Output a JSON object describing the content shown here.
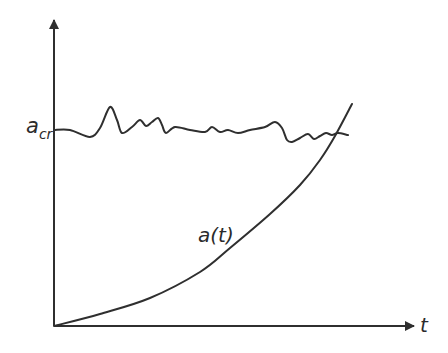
{
  "chart_data": {
    "type": "line",
    "title": "",
    "xlabel": "t",
    "ylabel": "",
    "grid": false,
    "legend": "none",
    "axes": {
      "x_arrow": true,
      "y_arrow": true,
      "ticks": false
    },
    "series": [
      {
        "name": "a_cr",
        "label": "a",
        "label_sub": "cr",
        "description": "fluctuating critical threshold, roughly constant",
        "points_px": [
          [
            54,
            130
          ],
          [
            70,
            130
          ],
          [
            90,
            137
          ],
          [
            100,
            128
          ],
          [
            110,
            107
          ],
          [
            117,
            120
          ],
          [
            122,
            133
          ],
          [
            132,
            127
          ],
          [
            140,
            120
          ],
          [
            146,
            126
          ],
          [
            152,
            122
          ],
          [
            158,
            118
          ],
          [
            162,
            125
          ],
          [
            166,
            133
          ],
          [
            175,
            127
          ],
          [
            190,
            130
          ],
          [
            205,
            132
          ],
          [
            212,
            127
          ],
          [
            220,
            132
          ],
          [
            228,
            130
          ],
          [
            238,
            133
          ],
          [
            250,
            130
          ],
          [
            265,
            127
          ],
          [
            275,
            122
          ],
          [
            282,
            128
          ],
          [
            287,
            140
          ],
          [
            292,
            142
          ],
          [
            300,
            138
          ],
          [
            308,
            134
          ],
          [
            314,
            139
          ],
          [
            320,
            136
          ],
          [
            326,
            133
          ],
          [
            332,
            135
          ],
          [
            338,
            133
          ],
          [
            348,
            135
          ]
        ]
      },
      {
        "name": "a(t)",
        "label": "a(t)",
        "description": "monotonically increasing, convex (exponential-like) growth",
        "points_px": [
          [
            54,
            326
          ],
          [
            100,
            314
          ],
          [
            150,
            298
          ],
          [
            200,
            272
          ],
          [
            230,
            248
          ],
          [
            270,
            214
          ],
          [
            300,
            185
          ],
          [
            320,
            160
          ],
          [
            335,
            136
          ],
          [
            352,
            104
          ]
        ]
      }
    ],
    "annotations": [
      {
        "text": "a(t)",
        "near": "curve midpoint"
      },
      {
        "text": "a_cr",
        "near": "y-axis at threshold level"
      }
    ]
  },
  "labels": {
    "acr_main": "a",
    "acr_sub": "cr",
    "at": "a(t)",
    "t": "t"
  },
  "colors": {
    "stroke": "#2f2f2f",
    "background": "#ffffff"
  }
}
